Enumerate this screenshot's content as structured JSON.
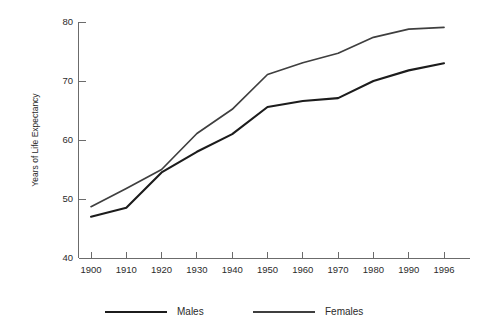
{
  "chart_data": {
    "type": "line",
    "title": "",
    "subtitle": "",
    "xlabel": "",
    "ylabel": "Years of Life Expectancy",
    "x": [
      1900,
      1910,
      1920,
      1930,
      1940,
      1950,
      1960,
      1970,
      1980,
      1990,
      1996
    ],
    "xticklabels": [
      "1900",
      "1910",
      "1920",
      "1930",
      "1940",
      "1950",
      "1960",
      "1970",
      "1980",
      "1990",
      "1996"
    ],
    "yticks": [
      40,
      50,
      60,
      70,
      80
    ],
    "yticklabels": [
      "40",
      "50",
      "60",
      "70",
      "80"
    ],
    "ylim": [
      40,
      80
    ],
    "xlim": [
      1900,
      1996
    ],
    "grid": false,
    "legend_position": "bottom",
    "series": [
      {
        "name": "Males",
        "color": "#1c1c1c",
        "values": [
          47.0,
          48.5,
          54.5,
          58.0,
          61.0,
          65.6,
          66.6,
          67.1,
          70.0,
          71.8,
          73.0
        ]
      },
      {
        "name": "Females",
        "color": "#3f3f3f",
        "values": [
          48.7,
          51.8,
          55.0,
          61.1,
          65.2,
          71.1,
          73.1,
          74.7,
          77.4,
          78.8,
          79.1
        ]
      }
    ],
    "annotations": []
  },
  "legend": {
    "items": [
      {
        "label": "Males"
      },
      {
        "label": "Females"
      }
    ]
  },
  "axes": {
    "y_title": "Years of Life Expectancy"
  }
}
